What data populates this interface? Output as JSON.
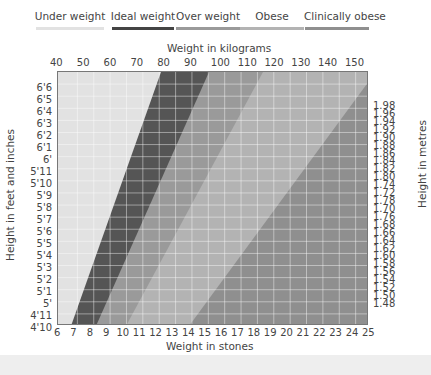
{
  "legend": {
    "items": [
      {
        "label": "Under weight",
        "color": "#e2e2e2"
      },
      {
        "label": "Ideal weight",
        "color": "#555555"
      },
      {
        "label": "Over weight",
        "color": "#9a9a9a"
      },
      {
        "label": "Obese",
        "color": "#b3b3b3"
      },
      {
        "label": "Clinically obese",
        "color": "#8f8f8f"
      }
    ]
  },
  "axes": {
    "top_title": "Weight in kilograms",
    "bottom_title": "Weight in stones",
    "left_title": "Height in feet and inches",
    "right_title": "Height in metres",
    "top_ticks": [
      "40",
      "50",
      "60",
      "70",
      "80",
      "90",
      "100",
      "110",
      "120",
      "130",
      "140",
      "150"
    ],
    "bottom_ticks": [
      "6",
      "7",
      "8",
      "9",
      "10",
      "11",
      "12",
      "13",
      "14",
      "15",
      "16",
      "17",
      "18",
      "19",
      "20",
      "21",
      "22",
      "23",
      "24",
      "25"
    ],
    "left_ticks": [
      "6'6",
      "6'5",
      "6'4",
      "6'3",
      "6'2",
      "6'1",
      "6'",
      "5'11",
      "5'10",
      "5'9",
      "5'8",
      "5'7",
      "5'6",
      "5'5",
      "5'4",
      "5'3",
      "5'2",
      "5'1",
      "5'",
      "4'11",
      "4'10"
    ],
    "right_ticks": [
      "1.98",
      "1.96",
      "1.94",
      "1.92",
      "1.90",
      "1.88",
      "1.86",
      "1.84",
      "1.82",
      "1.80",
      "1.74",
      "1.72",
      "1.78",
      "1.70",
      "1.76",
      "1.68",
      "1.66",
      "1.64",
      "1.62",
      "1.60",
      "1.58",
      "1.56",
      "1.54",
      "1.52",
      "1.50",
      "1.48"
    ]
  },
  "chart_data": {
    "type": "area",
    "xlabel": "Weight in kilograms (top) / Weight in stones (bottom)",
    "ylabel": "Height in feet and inches (left) / Height in metres (right)",
    "x_kg_range": [
      40,
      156
    ],
    "x_stone_range": [
      6,
      25
    ],
    "y_ft_range": [
      "4'10",
      "6'6"
    ],
    "y_m_range": [
      1.47,
      1.99
    ],
    "grid": true,
    "legend_position": "top",
    "series": [
      {
        "name": "Under weight",
        "color": "#e2e2e2",
        "upper_boundary_kg": {
          "height_4ft10": 43,
          "height_6ft6": 78
        }
      },
      {
        "name": "Ideal weight",
        "color": "#555555",
        "upper_boundary_kg": {
          "height_4ft10": 53,
          "height_6ft6": 96
        }
      },
      {
        "name": "Over weight",
        "color": "#9a9a9a",
        "upper_boundary_kg": {
          "height_4ft10": 64,
          "height_6ft6": 116
        }
      },
      {
        "name": "Obese",
        "color": "#b3b3b3",
        "upper_boundary_kg": {
          "height_4ft10": 88,
          "height_6ft6": 156
        }
      },
      {
        "name": "Clinically obese",
        "color": "#8f8f8f",
        "upper_boundary_kg": {
          "height_4ft10": 156,
          "height_6ft6": 156
        }
      }
    ]
  }
}
